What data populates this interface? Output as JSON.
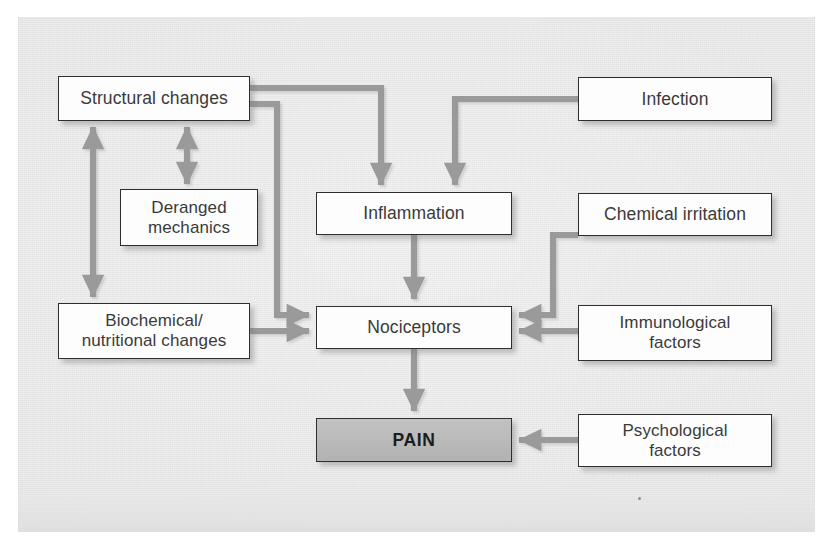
{
  "figure": {
    "kind": "flow-diagram",
    "title_visible": false,
    "panel_color": "#e9e9e9",
    "box_fill": "#fdfdfd",
    "box_border": "#2e2e2e",
    "highlight_fill": "#b7b7b7",
    "arrow_color": "#9a9a9a"
  },
  "nodes": {
    "structural_changes": {
      "label": "Structural changes"
    },
    "deranged_mechanics": {
      "label": "Deranged\nmechanics"
    },
    "biochemical_changes": {
      "label": "Biochemical/\nnutritional changes"
    },
    "infection": {
      "label": "Infection"
    },
    "inflammation": {
      "label": "Inflammation"
    },
    "chemical_irritation": {
      "label": "Chemical irritation"
    },
    "immunological_factors": {
      "label": "Immunological\nfactors"
    },
    "nociceptors": {
      "label": "Nociceptors"
    },
    "psychological_factors": {
      "label": "Psychological\nfactors"
    },
    "pain": {
      "label": "PAIN"
    }
  },
  "edges": [
    {
      "from": "structural_changes",
      "to": "inflammation",
      "style": "elbow",
      "heads": "one"
    },
    {
      "from": "structural_changes",
      "to": "nociceptors",
      "style": "elbow",
      "heads": "one"
    },
    {
      "from": "structural_changes",
      "to": "deranged_mechanics",
      "style": "straight-vertical",
      "heads": "both"
    },
    {
      "from": "structural_changes",
      "to": "biochemical_changes",
      "style": "straight-vertical",
      "heads": "both"
    },
    {
      "from": "infection",
      "to": "inflammation",
      "style": "elbow",
      "heads": "one"
    },
    {
      "from": "inflammation",
      "to": "nociceptors",
      "style": "straight-vertical",
      "heads": "one"
    },
    {
      "from": "biochemical_changes",
      "to": "nociceptors",
      "style": "straight-horizontal",
      "heads": "one"
    },
    {
      "from": "chemical_irritation",
      "to": "nociceptors",
      "style": "elbow",
      "heads": "one"
    },
    {
      "from": "immunological_factors",
      "to": "nociceptors",
      "style": "straight-horizontal",
      "heads": "one"
    },
    {
      "from": "nociceptors",
      "to": "pain",
      "style": "straight-vertical",
      "heads": "one"
    },
    {
      "from": "psychological_factors",
      "to": "pain",
      "style": "straight-horizontal",
      "heads": "one"
    }
  ]
}
